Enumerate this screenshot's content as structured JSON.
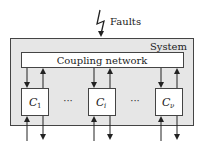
{
  "diagram": {
    "fault_label": "Faults",
    "system_label": "System",
    "coupling_label": "Coupling network",
    "components": [
      {
        "base": "C",
        "sub": "1"
      },
      {
        "base": "C",
        "sub": "i"
      },
      {
        "base": "C",
        "sub": "ν"
      }
    ],
    "ellipsis": "···",
    "colors": {
      "system_fill": "#e6e6e6",
      "box_fill": "#ffffff",
      "stroke": "#333333"
    }
  }
}
